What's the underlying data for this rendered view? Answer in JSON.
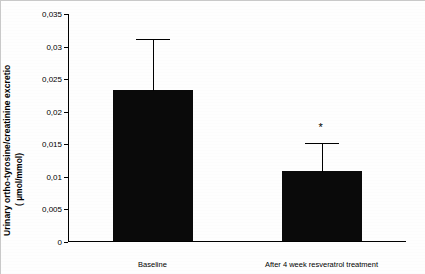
{
  "chart_data": {
    "type": "bar",
    "title": "",
    "xlabel": "",
    "ylabel_line1": "Urinary ortho-tyrosine/creatinine excretio",
    "ylabel_line2": "( µmol/mmol)",
    "categories": [
      "Baseline",
      "After 4 week resveratrol treatment"
    ],
    "values": [
      0.0232,
      0.0107
    ],
    "errors": [
      0.0078,
      0.0043
    ],
    "error_type": "upper",
    "ylim": [
      0,
      0.035
    ],
    "yticks": [
      0,
      0.005,
      0.01,
      0.015,
      0.02,
      0.025,
      0.03,
      0.035
    ],
    "ytick_labels": [
      "0",
      "0,005",
      "0,01",
      "0,015",
      "0,02",
      "0,025",
      "0,03",
      "0,035"
    ],
    "grid": false,
    "legend": "none",
    "bar_color": "#0a0a0a",
    "annotations": [
      {
        "text": "*",
        "series_index": 1,
        "value": 0.0168
      }
    ]
  }
}
